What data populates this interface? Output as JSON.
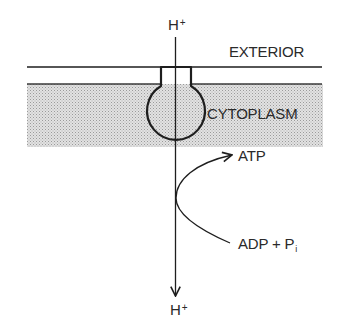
{
  "diagram": {
    "type": "ATP synthase proton flow across membrane",
    "labels": {
      "proton_top": {
        "base": "H",
        "sup": "+"
      },
      "exterior": "EXTERIOR",
      "cytoplasm": "CYTOPLASM",
      "atp": "ATP",
      "adp": {
        "text": "ADP + P",
        "sub": "i"
      },
      "proton_bottom": {
        "base": "H",
        "sup": "+"
      }
    },
    "colors": {
      "line": "#1e1e1e",
      "cytoplasm_fill": "#d6d6d6",
      "cytoplasm_dot": "#9a9a9a",
      "text": "#2a2a2a"
    }
  }
}
